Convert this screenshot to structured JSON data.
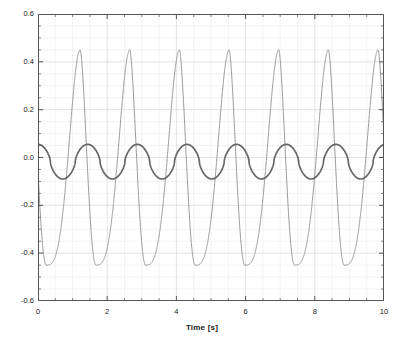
{
  "chart_data": {
    "type": "line",
    "title": "",
    "subtitle": "",
    "xlabel": "Time [s]",
    "ylabel": "",
    "xlim": [
      0,
      10
    ],
    "ylim": [
      -0.6,
      0.6
    ],
    "xticks": [
      0,
      2,
      4,
      6,
      8,
      10
    ],
    "xtick_labels": [
      "0",
      "2",
      "4",
      "6",
      "8",
      "10"
    ],
    "yticks": [
      -0.6,
      -0.4,
      -0.2,
      0.0,
      0.2,
      0.4,
      0.6
    ],
    "ytick_labels": [
      "-0.6",
      "-0.4",
      "-0.2",
      "0.0",
      "0.2",
      "0.4",
      "0.6"
    ],
    "x_minor_step": 0.5,
    "y_minor_step": 0.05,
    "grid": true,
    "grid_color": "#d8d8e0",
    "legend": null,
    "legend_position": "none",
    "background": "#ffffff",
    "axis_color": "#555555",
    "period": 1.435,
    "series": [
      {
        "name": "large-amplitude-wave",
        "color": "#8c8c8c",
        "line_width": 0.9,
        "shape": "asymmetric-sawtooth",
        "peak_value": 0.45,
        "trough_value": -0.45,
        "peak_times": [
          1.22,
          2.66,
          4.1,
          5.53,
          6.97,
          8.41,
          9.85
        ],
        "trough_times": [
          0.24,
          1.68,
          3.11,
          4.55,
          5.99,
          7.42,
          8.86
        ],
        "start_value": 0.055
      },
      {
        "name": "small-amplitude-wave",
        "color": "#666666",
        "line_width": 1.7,
        "shape": "smooth-periodic",
        "peak_value": 0.055,
        "trough_value": -0.09,
        "peak_times": [
          0.0,
          1.435,
          2.87,
          4.305,
          5.74,
          7.175,
          8.61,
          10.0
        ],
        "trough_times": [
          0.72,
          2.15,
          3.59,
          5.02,
          6.46,
          7.89,
          9.33
        ],
        "start_value": 0.055
      }
    ]
  }
}
